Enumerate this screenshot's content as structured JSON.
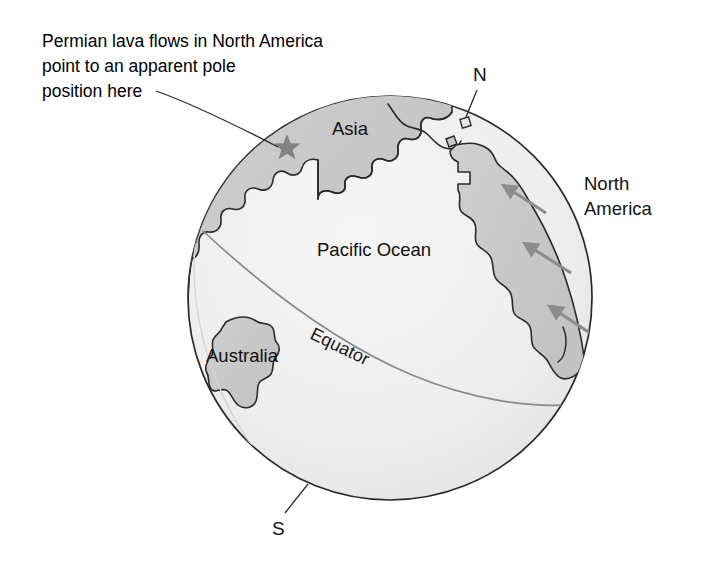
{
  "figure": {
    "title_caption": {
      "line1": "Permian lava flows in North America",
      "line2": "point to an apparent pole",
      "line3": "position here"
    },
    "labels": {
      "asia": "Asia",
      "pacific_ocean": "Pacific Ocean",
      "australia": "Australia",
      "north_america_line1": "North",
      "north_america_line2": "America",
      "equator": "Equator",
      "north_pole": "N",
      "south_pole": "S"
    },
    "colors": {
      "background": "#ffffff",
      "ocean_fill": "#efefef",
      "land_fill": "#c9c9c9",
      "outline": "#2a2a2a",
      "equator_line": "#8a8a8a",
      "arrow": "#8c8c8c",
      "star_marker": "#808080",
      "text": "#000000"
    },
    "geometry": {
      "globe_center_x": 390,
      "globe_center_y": 298,
      "globe_radius": 203
    },
    "markers": {
      "apparent_pole_star": "star-marker",
      "north_pole_square": "square-marker"
    },
    "arrow_count": 3
  }
}
